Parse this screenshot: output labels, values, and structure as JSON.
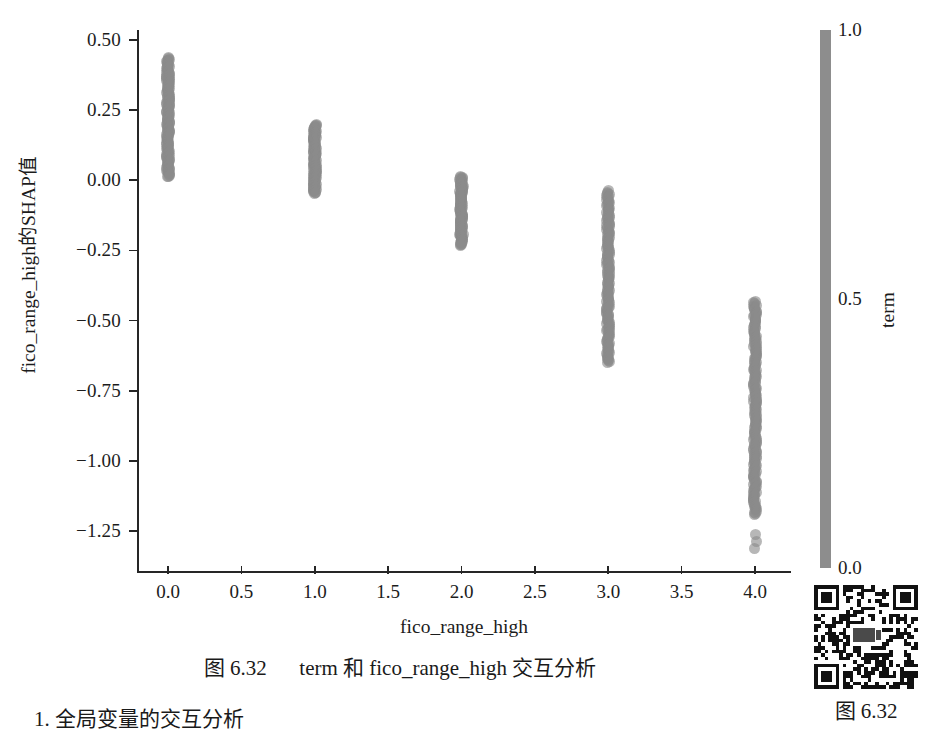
{
  "chart_data": {
    "type": "scatter",
    "title": "",
    "xlabel": "fico_range_high",
    "ylabel": "fico_range_high的SHAP值",
    "xlim": [
      -0.21,
      4.24
    ],
    "ylim": [
      -1.38,
      0.56
    ],
    "xticks": [
      "0.0",
      "0.5",
      "1.0",
      "1.5",
      "2.0",
      "2.5",
      "3.0",
      "3.5",
      "4.0"
    ],
    "xtick_values": [
      0.0,
      0.5,
      1.0,
      1.5,
      2.0,
      2.5,
      3.0,
      3.5,
      4.0
    ],
    "yticks": [
      "0.50",
      "0.25",
      "0.00",
      "−0.25",
      "−0.50",
      "−0.75",
      "−1.00",
      "−1.25"
    ],
    "ytick_values": [
      0.5,
      0.25,
      0.0,
      -0.25,
      -0.5,
      -0.75,
      -1.0,
      -1.25
    ],
    "grid": false,
    "legend": "none",
    "point_color": "#8a8a8a",
    "colorbar": {
      "label": "term",
      "ticks": [
        "1.0",
        "0.5",
        "0.0"
      ],
      "tick_values": [
        1.0,
        0.5,
        0.0
      ],
      "vmin": 0.0,
      "vmax": 1.0,
      "color": "#8d8d8d"
    },
    "series": [
      {
        "name": "fico_range_high = 0",
        "x": 0.0,
        "y_min": 0.012,
        "y_max": 0.437,
        "n_points": 150
      },
      {
        "name": "fico_range_high = 1",
        "x": 1.0,
        "y_min": -0.047,
        "y_max": 0.198,
        "n_points": 110
      },
      {
        "name": "fico_range_high = 2",
        "x": 2.0,
        "y_min": -0.232,
        "y_max": 0.013,
        "n_points": 110
      },
      {
        "name": "fico_range_high = 3",
        "x": 3.0,
        "y_min": -0.651,
        "y_max": -0.038,
        "n_points": 150
      },
      {
        "name": "fico_range_high = 4",
        "x": 4.0,
        "y_min": -1.192,
        "y_max": -0.432,
        "n_points": 180,
        "outliers": [
          -1.262,
          -1.286,
          -1.312
        ]
      }
    ]
  },
  "figure": {
    "caption_prefix": "图 6.32",
    "caption_text": "term 和 fico_range_high 交互分析"
  },
  "qr": {
    "caption": "图 6.32",
    "icon": "qr-code-icon"
  },
  "body": {
    "cropped_line": "1. 全局变量的交互分析"
  }
}
